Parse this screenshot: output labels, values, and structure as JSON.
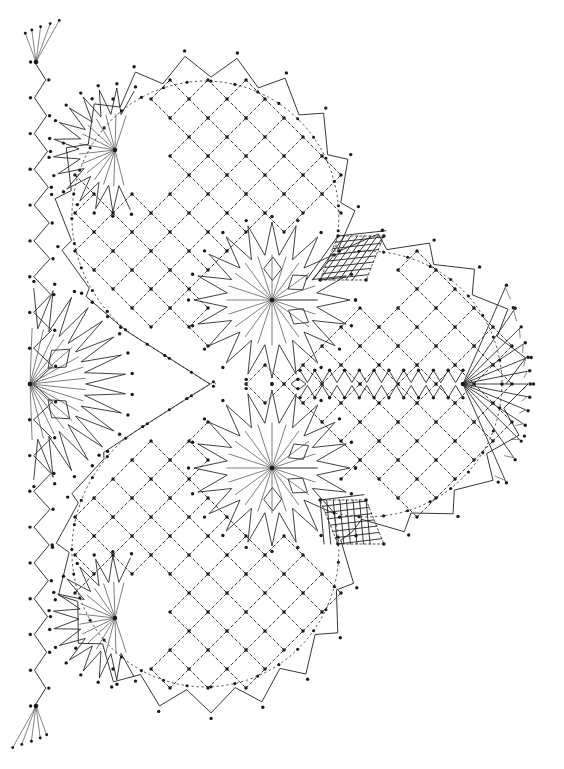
{
  "document": {
    "title": "Bobbin Lace Pattern Diagram",
    "kind": "lace-working-diagram",
    "caption": "",
    "width": 564,
    "height": 769
  },
  "canvas": {
    "background_color": "#ffffff",
    "ink_color": "#2b2b2b",
    "ink_color_light": "#555555",
    "dot_color": "#1a1a1a",
    "stroke_width": 0.9,
    "dash_pattern": "3 2.6",
    "dot_radius": 1.7,
    "dot_radius_large": 2.3
  },
  "geometry": {
    "symmetry": "mirror about horizontal axis",
    "mirror_axis_y": 384,
    "net_spacing": 38,
    "net_orientation": "45-degree diamond lattice",
    "lobes": 3,
    "lobe_centers": [
      {
        "name": "top-lobe",
        "cx": 205,
        "cy": 205,
        "r": 150
      },
      {
        "name": "bottom-lobe",
        "cx": 205,
        "cy": 563,
        "r": 150
      },
      {
        "name": "right-lobe",
        "cx": 378,
        "cy": 384,
        "r": 150
      }
    ],
    "star_motifs": [
      {
        "name": "center-top-star",
        "cx": 272,
        "cy": 300,
        "rays": 40,
        "r_outer": 78,
        "leaves": 3
      },
      {
        "name": "center-bottom-star",
        "cx": 272,
        "cy": 468,
        "rays": 40,
        "r_outer": 78,
        "leaves": 3
      },
      {
        "name": "left-point-star",
        "cx": 30,
        "cy": 384,
        "rays": 30,
        "r_outer": 96,
        "leaves": 2
      },
      {
        "name": "upper-sunburst",
        "cx": 115,
        "cy": 150,
        "rays": 26,
        "r_outer": 62,
        "leaves": 0
      },
      {
        "name": "lower-sunburst",
        "cx": 115,
        "cy": 618,
        "rays": 26,
        "r_outer": 62,
        "leaves": 0
      }
    ],
    "right_point": {
      "x": 463,
      "y": 384,
      "tip_x": 530
    },
    "crosshatch_blocks": [
      {
        "name": "upper-cloth-block",
        "cx": 352,
        "cy": 258,
        "w": 46,
        "h": 44,
        "skew": -22,
        "threads": 7
      },
      {
        "name": "lower-cloth-block",
        "cx": 352,
        "cy": 522,
        "w": 46,
        "h": 44,
        "skew": 22,
        "threads": 7
      }
    ],
    "zigzag_edge": {
      "name": "picot-scallop-border",
      "tooth_count_per_lobe": 26,
      "tooth_depth": 22
    },
    "left_zigzag_band": {
      "name": "left-vertical-braid",
      "x": 36,
      "y_top": 62,
      "y_bottom": 706,
      "amplitude": 17,
      "periods": 18
    },
    "center_zigzag_band": {
      "name": "center-horizontal-braid",
      "y": 384,
      "x_start": 300,
      "x_end": 463,
      "amplitude": 12,
      "periods": 11,
      "rows": 2
    }
  },
  "elements": {
    "net_ground_label": "diamond net ground",
    "star_label": "spider / star motif",
    "leaf_label": "leaf tally",
    "cloth_label": "cloth-stitch block",
    "border_label": "picot edge"
  }
}
